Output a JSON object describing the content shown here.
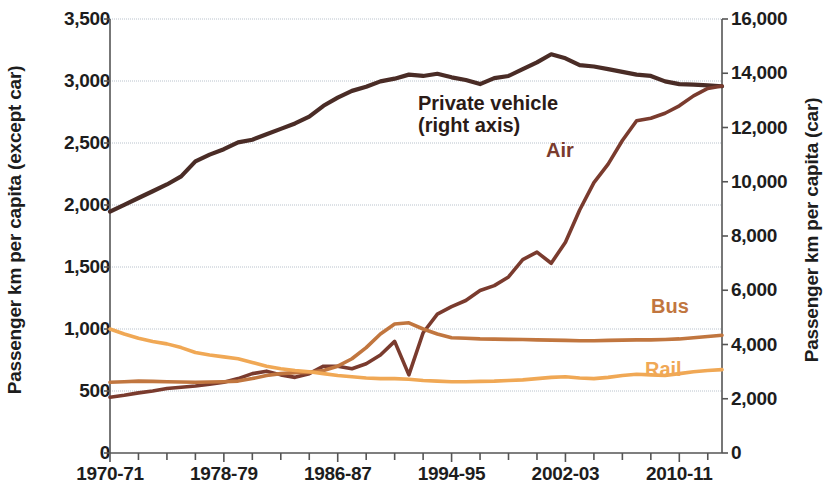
{
  "chart_data": {
    "type": "line",
    "title": "",
    "xlabel": "",
    "ylabel": "Passenger km per capita (except car)",
    "y2label": "Passenger km per capita (car)",
    "ylim": [
      0,
      3500
    ],
    "y2lim": [
      0,
      16000
    ],
    "grid": true,
    "legend_position": "in-plot-annotations",
    "x_tick_labels": [
      "1970-71",
      "1978-79",
      "1986-87",
      "1994-95",
      "2002-03",
      "2010-11"
    ],
    "x_tick_years": [
      1970,
      1978,
      1986,
      1994,
      2002,
      2010
    ],
    "y_tick_labels": [
      "0",
      "500",
      "1,000",
      "1,500",
      "2,000",
      "2,500",
      "3,000",
      "3,500"
    ],
    "y_tick_values": [
      0,
      500,
      1000,
      1500,
      2000,
      2500,
      3000,
      3500
    ],
    "y2_tick_labels": [
      "0",
      "2,000",
      "4,000",
      "6,000",
      "8,000",
      "10,000",
      "12,000",
      "14,000",
      "16,000"
    ],
    "y2_tick_values": [
      0,
      2000,
      4000,
      6000,
      8000,
      10000,
      12000,
      14000,
      16000
    ],
    "x": [
      1970,
      1971,
      1972,
      1973,
      1974,
      1975,
      1976,
      1977,
      1978,
      1979,
      1980,
      1981,
      1982,
      1983,
      1984,
      1985,
      1986,
      1987,
      1988,
      1989,
      1990,
      1991,
      1992,
      1993,
      1994,
      1995,
      1996,
      1997,
      1998,
      1999,
      2000,
      2001,
      2002,
      2003,
      2004,
      2005,
      2006,
      2007,
      2008,
      2009,
      2010,
      2011,
      2012,
      2013
    ],
    "series": [
      {
        "name": "Private vehicle",
        "axis": "right",
        "color": "#4a2c26",
        "note": "right axis",
        "values": [
          8900,
          9150,
          9400,
          9650,
          9900,
          10200,
          10750,
          11000,
          11200,
          11450,
          11550,
          11750,
          11950,
          12150,
          12400,
          12800,
          13100,
          13350,
          13500,
          13700,
          13800,
          13950,
          13900,
          13980,
          13850,
          13750,
          13600,
          13820,
          13900,
          14150,
          14400,
          14700,
          14550,
          14300,
          14250,
          14150,
          14050,
          13950,
          13900,
          13700,
          13600,
          13580,
          13550,
          13520
        ]
      },
      {
        "name": "Air",
        "axis": "left",
        "color": "#7a3b2e",
        "values": [
          450,
          465,
          485,
          500,
          520,
          530,
          540,
          555,
          570,
          600,
          640,
          660,
          630,
          610,
          640,
          700,
          700,
          680,
          720,
          790,
          900,
          630,
          970,
          1120,
          1180,
          1230,
          1310,
          1350,
          1420,
          1560,
          1620,
          1530,
          1700,
          1960,
          2180,
          2330,
          2520,
          2680,
          2700,
          2740,
          2800,
          2880,
          2940,
          2960
        ]
      },
      {
        "name": "Bus",
        "axis": "left",
        "color": "#c1763f",
        "values": [
          570,
          575,
          580,
          578,
          575,
          572,
          570,
          572,
          575,
          580,
          600,
          625,
          640,
          648,
          650,
          665,
          700,
          760,
          850,
          960,
          1040,
          1050,
          1000,
          960,
          930,
          925,
          920,
          918,
          916,
          915,
          912,
          910,
          908,
          905,
          905,
          908,
          910,
          912,
          912,
          915,
          920,
          930,
          940,
          950
        ]
      },
      {
        "name": "Rail",
        "axis": "left",
        "color": "#f0a855",
        "values": [
          1000,
          960,
          925,
          900,
          880,
          850,
          810,
          790,
          775,
          760,
          730,
          700,
          680,
          665,
          655,
          640,
          625,
          615,
          605,
          600,
          600,
          595,
          585,
          580,
          575,
          575,
          578,
          580,
          585,
          590,
          600,
          610,
          615,
          605,
          600,
          610,
          625,
          635,
          630,
          625,
          640,
          655,
          665,
          672
        ]
      }
    ],
    "annotations": [
      {
        "id": "private-vehicle-label",
        "text_line1": "Private vehicle",
        "text_line2": "(right axis)",
        "color": "#2b1b17"
      },
      {
        "id": "air-label",
        "text": "Air",
        "color": "#7a3b2e"
      },
      {
        "id": "bus-label",
        "text": "Bus",
        "color": "#c1763f"
      },
      {
        "id": "rail-label",
        "text": "Rail",
        "color": "#f0a855"
      }
    ]
  },
  "axes": {
    "left_title": "Passenger km per capita (except car)",
    "right_title": "Passenger km per capita (car)"
  },
  "labels": {
    "private_vehicle_line1": "Private vehicle",
    "private_vehicle_line2": "(right axis)",
    "air": "Air",
    "bus": "Bus",
    "rail": "Rail"
  }
}
